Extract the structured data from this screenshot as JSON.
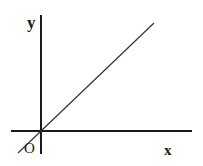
{
  "diagram": {
    "type": "coordinate-axes-with-line",
    "labels": {
      "y_axis": "y",
      "x_axis": "x",
      "origin": "O"
    },
    "colors": {
      "background": "#ffffff",
      "axis": "#1a1a1a",
      "line": "#333333",
      "text": "#1a1a1a"
    },
    "elements": [
      {
        "kind": "axis",
        "name": "x-axis",
        "orientation": "horizontal"
      },
      {
        "kind": "axis",
        "name": "y-axis",
        "orientation": "vertical"
      },
      {
        "kind": "line",
        "name": "proportional-line",
        "description": "straight line through the origin with positive slope (y = kx, k > 0)"
      }
    ]
  }
}
